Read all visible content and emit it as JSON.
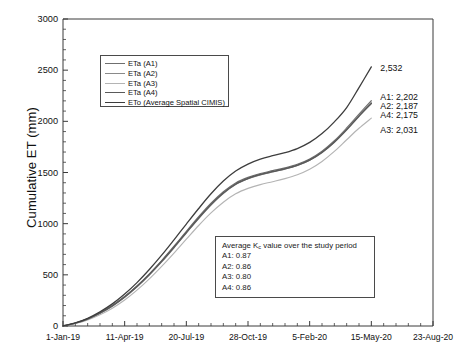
{
  "chart_data": {
    "type": "line",
    "title": "",
    "xlabel": "",
    "ylabel": "Cumulative ET (mm)",
    "ylim": [
      0,
      3000
    ],
    "ytick_values": [
      0,
      500,
      1000,
      1500,
      2000,
      2500,
      3000
    ],
    "ytick_labels": [
      "0",
      "500",
      "1000",
      "1500",
      "2000",
      "2500",
      "3000"
    ],
    "y_minor_step": 100,
    "xlim_days": [
      0,
      600
    ],
    "xtick_labels": [
      "1-Jan-19",
      "11-Apr-19",
      "20-Jul-19",
      "28-Oct-19",
      "5-Feb-20",
      "15-May-20",
      "23-Aug-20"
    ],
    "xtick_days": [
      0,
      100,
      200,
      300,
      400,
      500,
      600
    ],
    "grid": false,
    "legend_position": "upper-left-inside",
    "series": [
      {
        "name": "ETa (A1)",
        "color": "#6f6f6f",
        "width": 1.15,
        "end_value": 2202,
        "x": [
          0,
          20,
          40,
          60,
          80,
          100,
          120,
          140,
          160,
          180,
          200,
          220,
          240,
          260,
          280,
          300,
          320,
          340,
          360,
          380,
          400,
          420,
          440,
          460,
          480,
          500
        ],
        "y": [
          0,
          28,
          70,
          128,
          200,
          288,
          392,
          510,
          640,
          780,
          925,
          1068,
          1200,
          1312,
          1398,
          1452,
          1490,
          1518,
          1545,
          1580,
          1632,
          1708,
          1810,
          1935,
          2070,
          2202
        ]
      },
      {
        "name": "ETa (A2)",
        "color": "#8a8a8a",
        "width": 1.15,
        "end_value": 2187,
        "x": [
          0,
          20,
          40,
          60,
          80,
          100,
          120,
          140,
          160,
          180,
          200,
          220,
          240,
          260,
          280,
          300,
          320,
          340,
          360,
          380,
          400,
          420,
          440,
          460,
          480,
          500
        ],
        "y": [
          0,
          27,
          68,
          124,
          194,
          280,
          382,
          498,
          626,
          764,
          908,
          1050,
          1182,
          1295,
          1382,
          1438,
          1477,
          1506,
          1533,
          1568,
          1620,
          1696,
          1798,
          1922,
          2056,
          2187
        ]
      },
      {
        "name": "ETa (A3)",
        "color": "#b4b4b4",
        "width": 1.15,
        "end_value": 2031,
        "x": [
          0,
          20,
          40,
          60,
          80,
          100,
          120,
          140,
          160,
          180,
          200,
          220,
          240,
          260,
          280,
          300,
          320,
          340,
          360,
          380,
          400,
          420,
          440,
          460,
          480,
          500
        ],
        "y": [
          0,
          24,
          60,
          110,
          174,
          254,
          350,
          460,
          582,
          712,
          848,
          982,
          1105,
          1210,
          1292,
          1345,
          1382,
          1410,
          1440,
          1478,
          1532,
          1608,
          1706,
          1820,
          1932,
          2031
        ]
      },
      {
        "name": "ETa (A4)",
        "color": "#5a5a5a",
        "width": 1.5,
        "end_value": 2175,
        "x": [
          0,
          20,
          40,
          60,
          80,
          100,
          120,
          140,
          160,
          180,
          200,
          220,
          240,
          260,
          280,
          300,
          320,
          340,
          360,
          380,
          400,
          420,
          440,
          460,
          480,
          500
        ],
        "y": [
          0,
          28,
          69,
          126,
          197,
          284,
          387,
          504,
          632,
          770,
          914,
          1056,
          1188,
          1300,
          1387,
          1442,
          1480,
          1509,
          1536,
          1571,
          1622,
          1697,
          1797,
          1918,
          2050,
          2175
        ]
      },
      {
        "name": "ETo (Average Spatial CIMIS)",
        "color": "#3d3d3d",
        "width": 1.3,
        "end_value": 2532,
        "x": [
          0,
          20,
          40,
          60,
          80,
          100,
          120,
          140,
          160,
          180,
          200,
          220,
          240,
          260,
          280,
          300,
          320,
          340,
          360,
          380,
          400,
          420,
          440,
          460,
          480,
          500
        ],
        "y": [
          0,
          30,
          75,
          138,
          216,
          312,
          424,
          552,
          692,
          842,
          996,
          1148,
          1292,
          1416,
          1514,
          1582,
          1630,
          1664,
          1694,
          1734,
          1794,
          1880,
          1995,
          2135,
          2330,
          2532
        ]
      }
    ],
    "end_annotations": [
      {
        "label": "2,532",
        "value": 2532
      },
      {
        "label": "A1: 2,202",
        "value": 2202
      },
      {
        "label": "A2: 2,187",
        "value": 2187
      },
      {
        "label": "A4: 2,175",
        "value": 2175
      },
      {
        "label": "A3: 2,031",
        "value": 2031
      }
    ]
  },
  "legend": {
    "items": [
      {
        "label": "ETa (A1)"
      },
      {
        "label": "ETa (A2)"
      },
      {
        "label": "ETa (A3)"
      },
      {
        "label": "ETa (A4)"
      },
      {
        "label": "ETo (Average Spatial CIMIS)"
      }
    ]
  },
  "kc_box": {
    "title_prefix": "Average K",
    "title_sub": "c",
    "title_suffix": " value over the study period",
    "rows": [
      "A1: 0.87",
      "A2: 0.86",
      "A3: 0.80",
      "A4: 0.86"
    ]
  },
  "axis": {
    "y_title": "Cumulative ET (mm)"
  }
}
